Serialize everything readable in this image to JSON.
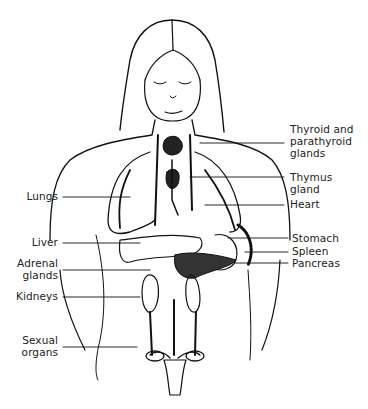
{
  "diagram": {
    "type": "anatomical line drawing",
    "colors": {
      "background": "#ffffff",
      "ink": "#111111",
      "text": "#222222"
    },
    "labels_left": [
      {
        "id": "lungs",
        "text": "Lungs"
      },
      {
        "id": "liver",
        "text": "Liver"
      },
      {
        "id": "adrenal",
        "text": "Adrenal\nglands"
      },
      {
        "id": "kidneys",
        "text": "Kidneys"
      },
      {
        "id": "sexual",
        "text": "Sexual\norgans"
      }
    ],
    "labels_right": [
      {
        "id": "thyroid",
        "text": "Thyroid and\nparathyroid\nglands"
      },
      {
        "id": "thymus",
        "text": "Thymus\ngland"
      },
      {
        "id": "heart",
        "text": "Heart"
      },
      {
        "id": "stomach",
        "text": "Stomach"
      },
      {
        "id": "spleen",
        "text": "Spleen"
      },
      {
        "id": "pancreas",
        "text": "Pancreas"
      }
    ]
  }
}
